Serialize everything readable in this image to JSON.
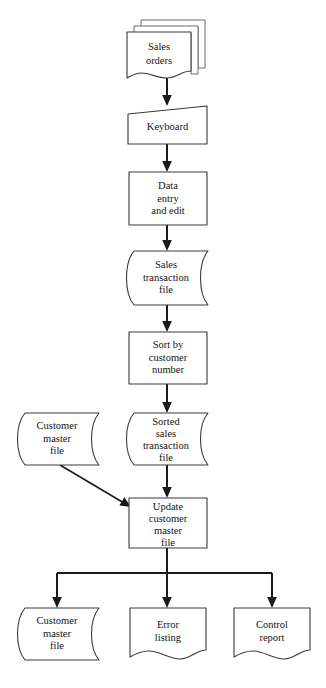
{
  "diagram": {
    "background_color": "#ffffff",
    "line_color": "#1a1a1a",
    "shape_stroke_color": "#3a3a3a",
    "nodes": [
      {
        "id": "sales-orders",
        "label_lines": [
          "Sales",
          "orders"
        ],
        "shape": "multi-document",
        "x": 125,
        "y": 20,
        "width": 68,
        "height": 58
      },
      {
        "id": "keyboard",
        "label_lines": [
          "Keyboard"
        ],
        "shape": "manual-input",
        "x": 128,
        "y": 106,
        "width": 79,
        "height": 38
      },
      {
        "id": "data-entry-and-edit",
        "label_lines": [
          "Data",
          "entry",
          "and edit"
        ],
        "shape": "process",
        "x": 129,
        "y": 172,
        "width": 78,
        "height": 53
      },
      {
        "id": "sales-transaction-file",
        "label_lines": [
          "Sales",
          "transaction",
          "file"
        ],
        "shape": "magnetic-tape",
        "x": 126,
        "y": 251,
        "width": 82,
        "height": 54
      },
      {
        "id": "sort-by-customer-number",
        "label_lines": [
          "Sort by",
          "customer",
          "number"
        ],
        "shape": "process",
        "x": 129,
        "y": 332,
        "width": 78,
        "height": 52
      },
      {
        "id": "customer-master-file-input",
        "label_lines": [
          "Customer",
          "master",
          "file"
        ],
        "shape": "magnetic-tape",
        "x": 16,
        "y": 413,
        "width": 83,
        "height": 52
      },
      {
        "id": "sorted-sales-transaction-file",
        "label_lines": [
          "Sorted",
          "sales",
          "transaction",
          "file"
        ],
        "shape": "magnetic-tape",
        "x": 126,
        "y": 413,
        "width": 82,
        "height": 52
      },
      {
        "id": "update-customer-master-file",
        "label_lines": [
          "Update",
          "customer",
          "master",
          "file"
        ],
        "shape": "process",
        "x": 129,
        "y": 498,
        "width": 78,
        "height": 50
      },
      {
        "id": "customer-master-file-output",
        "label_lines": [
          "Customer",
          "master",
          "file"
        ],
        "shape": "magnetic-tape",
        "x": 16,
        "y": 608,
        "width": 83,
        "height": 52
      },
      {
        "id": "error-listing",
        "label_lines": [
          "Error",
          "listing"
        ],
        "shape": "document",
        "x": 130,
        "y": 608,
        "width": 76,
        "height": 52
      },
      {
        "id": "control-report",
        "label_lines": [
          "Control",
          "report"
        ],
        "shape": "document",
        "x": 234,
        "y": 608,
        "width": 76,
        "height": 52
      }
    ],
    "connectors": [
      {
        "id": "sales-orders-to-keyboard",
        "from": "sales-orders",
        "to": "keyboard",
        "kind": "vertical-arrow"
      },
      {
        "id": "keyboard-to-data-entry",
        "from": "keyboard",
        "to": "data-entry-and-edit",
        "kind": "vertical-arrow"
      },
      {
        "id": "data-entry-to-sales-transaction-file",
        "from": "data-entry-and-edit",
        "to": "sales-transaction-file",
        "kind": "vertical-arrow"
      },
      {
        "id": "sales-transaction-file-to-sort",
        "from": "sales-transaction-file",
        "to": "sort-by-customer-number",
        "kind": "vertical-arrow"
      },
      {
        "id": "sort-to-sorted-sales-transaction-file",
        "from": "sort-by-customer-number",
        "to": "sorted-sales-transaction-file",
        "kind": "vertical-arrow"
      },
      {
        "id": "sorted-sales-transaction-file-to-update",
        "from": "sorted-sales-transaction-file",
        "to": "update-customer-master-file",
        "kind": "vertical-arrow"
      },
      {
        "id": "customer-master-file-to-update",
        "from": "customer-master-file-input",
        "to": "update-customer-master-file",
        "kind": "diagonal-arrow"
      },
      {
        "id": "update-to-customer-master-file-output",
        "from": "update-customer-master-file",
        "to": "customer-master-file-output",
        "kind": "branch-arrow"
      },
      {
        "id": "update-to-error-listing",
        "from": "update-customer-master-file",
        "to": "error-listing",
        "kind": "branch-arrow"
      },
      {
        "id": "update-to-control-report",
        "from": "update-customer-master-file",
        "to": "control-report",
        "kind": "branch-arrow"
      }
    ]
  }
}
